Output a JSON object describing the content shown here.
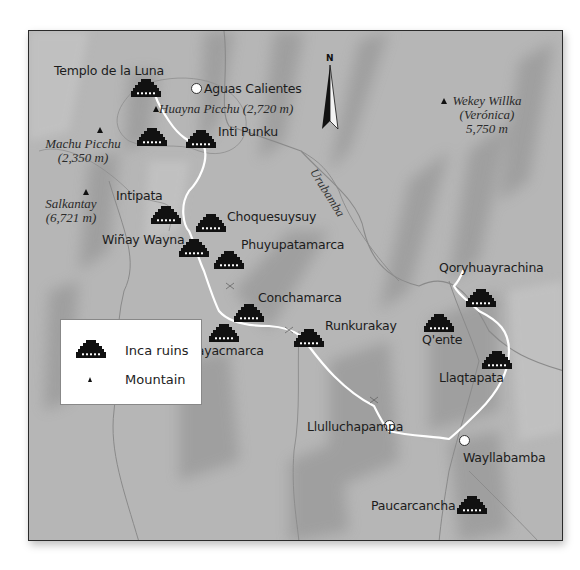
{
  "map": {
    "colors": {
      "background": "#b4b4b4",
      "ridge": "#9a9a9a",
      "trail": "#ffffff",
      "river": "#8a8a8a",
      "ruin_icon": "#111111",
      "text": "#1c1c1c"
    },
    "north_label": "N",
    "ruins": [
      {
        "name": "Templo de la Luna"
      },
      {
        "name": "Machu Picchu ruin"
      },
      {
        "name": "Inti Punku"
      },
      {
        "name": "Intipata"
      },
      {
        "name": "Choquesuysuy"
      },
      {
        "name": "Wiñay Wayna"
      },
      {
        "name": "Phuyupatamarca"
      },
      {
        "name": "Conchamarca"
      },
      {
        "name": "Sayacmarca"
      },
      {
        "name": "Runkurakay"
      },
      {
        "name": "Qoryhuayrachina"
      },
      {
        "name": "Q'ente"
      },
      {
        "name": "Llaqtapata"
      },
      {
        "name": "Paucarcancha"
      }
    ],
    "ruin_labels": {
      "templo": "Templo de la Luna",
      "inti_punku": "Inti Punku",
      "intipata": "Intipata",
      "choquesuysuy": "Choquesuysuy",
      "winay_wayna": "Wiñay Wayna",
      "phuyupatamarca": "Phuyupatamarca",
      "conchamarca": "Conchamarca",
      "sayacmarca": "Sayacmarca",
      "runkurakay": "Runkurakay",
      "qoryhuayrachina": "Qoryhuayrachina",
      "qente": "Q'ente",
      "llaqtapata": "Llaqtapata",
      "paucarcancha": "Paucarcancha"
    },
    "towns": {
      "aguas_calientes": "Aguas Calientes",
      "llulluchapampa": "Llulluchapampa",
      "wayllabamba": "Wayllabamba"
    },
    "mountains": {
      "huayna_picchu": "Huayna Picchu (2,720 m)",
      "machu_picchu_name": "Machu Picchu",
      "machu_picchu_elev": "(2,350 m)",
      "salkantay_name": "Salkantay",
      "salkantay_elev": "(6,721 m)",
      "wekey_name": "Wekey Willka",
      "wekey_alt": "(Verónica)",
      "wekey_elev": "5,750 m"
    },
    "rivers": {
      "urubamba": "Urubamba",
      "aobamba": "Aobamba"
    }
  },
  "legend": {
    "items": [
      {
        "icon": "inca-ruins-icon",
        "label": "Inca ruins"
      },
      {
        "icon": "mountain-icon",
        "label": "Mountain"
      }
    ]
  }
}
